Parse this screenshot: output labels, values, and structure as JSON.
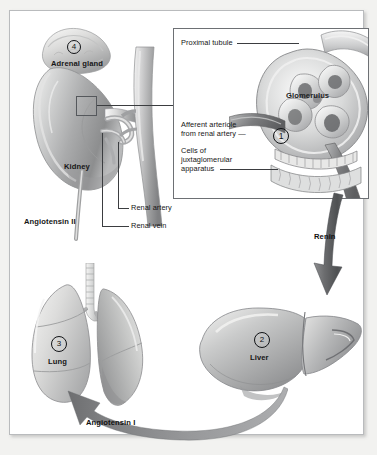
{
  "figure": {
    "background_color": "#f2f2f0",
    "panel_color": "#ffffff",
    "panel_border_color": "#b9bbbd",
    "ink_color": "#161616",
    "leader_color": "#3b3d40"
  },
  "inset": {
    "border_color": "#6d7074",
    "labels": {
      "proximal_tubule": "Proximal tubule",
      "afferent_arteriole_line1": "Afferent arteriole",
      "afferent_arteriole_line2": "from renal artery —",
      "jga_line1": "Cells of",
      "jga_line2": "juxtaglomerular",
      "jga_line3": "apparatus",
      "glomerulus": "Glomerulus"
    },
    "marker": {
      "number": "1"
    }
  },
  "organs": {
    "adrenal_gland": {
      "label": "Adrenal gland",
      "number": "4"
    },
    "kidney": {
      "label": "Kidney"
    },
    "liver": {
      "label": "Liver",
      "number": "2"
    },
    "lung": {
      "label": "Lung",
      "number": "3"
    }
  },
  "vessels": {
    "renal_artery": "Renal artery",
    "renal_vein": "Renal vein"
  },
  "pathway": {
    "angiotensin_ii": "Angiotensin II",
    "angiotensin_i": "Angiotensin I",
    "renin": "Renin"
  }
}
